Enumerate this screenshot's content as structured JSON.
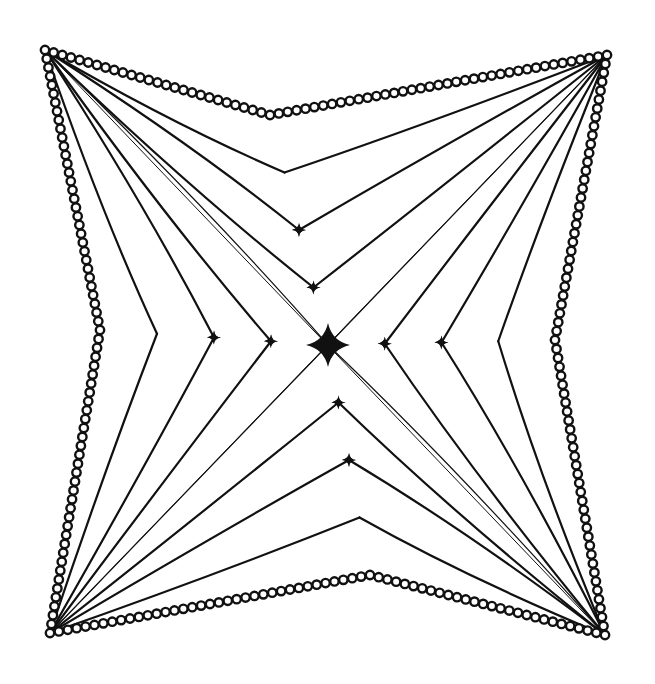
{
  "artwork": {
    "kind": "pen-and-ink zentangle pattern",
    "ink_color": "#111111",
    "paper_color": "#ffffff",
    "corners": {
      "top_left": [
        45,
        50
      ],
      "top_right": [
        607,
        55
      ],
      "bottom_right": [
        605,
        635
      ],
      "bottom_left": [
        50,
        633
      ]
    },
    "edge_inward_points": {
      "top": [
        270,
        115
      ],
      "right": [
        555,
        340
      ],
      "bottom": [
        370,
        575
      ],
      "left": [
        100,
        330
      ]
    },
    "center": [
      328,
      345
    ],
    "rays_per_corner": 7,
    "border_style": "chain of small circles"
  }
}
